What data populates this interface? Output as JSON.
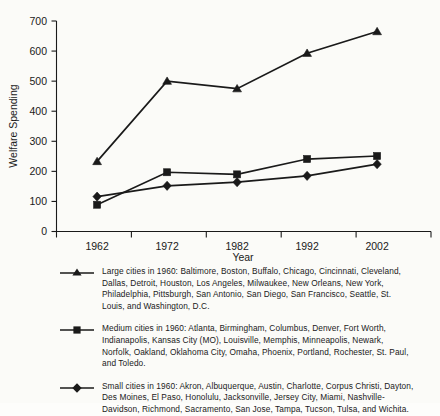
{
  "chart_data": {
    "type": "line",
    "title": "",
    "xlabel": "Year",
    "ylabel": "Welfare Spending",
    "categories": [
      "1962",
      "1972",
      "1982",
      "1992",
      "2002"
    ],
    "x": [
      1962,
      1972,
      1982,
      1992,
      2002
    ],
    "ylim": [
      0,
      700
    ],
    "yticks": [
      0,
      100,
      200,
      300,
      400,
      500,
      600,
      700
    ],
    "ytick_labels": [
      "0",
      "100",
      "200",
      "300",
      "400",
      "500",
      "600",
      "700"
    ],
    "grid": false,
    "legend_position": "below",
    "series": [
      {
        "name": "Large cities in 1960",
        "marker": "triangle",
        "values": [
          233,
          500,
          475,
          593,
          665
        ]
      },
      {
        "name": "Medium cities in 1960",
        "marker": "square",
        "values": [
          89,
          197,
          190,
          241,
          251
        ]
      },
      {
        "name": "Small cities in 1960",
        "marker": "diamond",
        "values": [
          116,
          152,
          164,
          185,
          224
        ]
      }
    ]
  },
  "axes": {
    "y_title": "Welfare Spending",
    "x_title": "Year"
  },
  "legend": {
    "entries": [
      {
        "marker_name": "triangle-marker-icon",
        "text": "Large cities in 1960: Baltimore, Boston, Buffalo, Chicago, Cincinnati, Cleveland, Dallas, Detroit, Houston, Los Angeles, Milwaukee, New Orleans, New York, Philadelphia, Pittsburgh, San Antonio, San Diego, San Francisco, Seattle, St. Louis, and Washington, D.C."
      },
      {
        "marker_name": "square-marker-icon",
        "text": "Medium cities in 1960: Atlanta, Birmingham, Columbus, Denver, Fort Worth, Indianapolis, Kansas City (MO), Louisville, Memphis, Minneapolis, Newark, Norfolk, Oakland, Oklahoma City, Omaha, Phoenix, Portland, Rochester, St. Paul, and Toledo."
      },
      {
        "marker_name": "diamond-marker-icon",
        "text": "Small cities in 1960: Akron, Albuquerque, Austin, Charlotte, Corpus Christi, Dayton, Des Moines, El Paso, Honolulu, Jacksonville, Jersey City, Miami, Nashville-Davidson, Richmond, Sacramento, San Jose, Tampa, Tucson, Tulsa, and Wichita."
      }
    ]
  },
  "colors": {
    "ink": "#1a1a1a",
    "background": "#fbfbf8"
  }
}
